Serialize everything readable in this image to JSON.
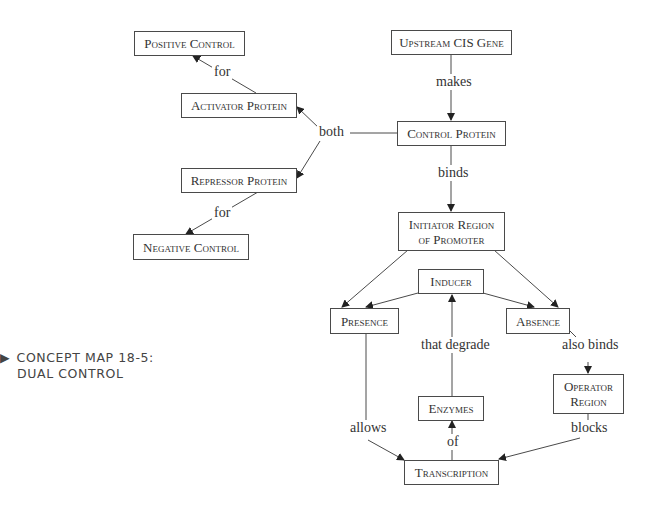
{
  "caption": {
    "marker": "▶",
    "line1": "CONCEPT MAP 18-5:",
    "line2": "DUAL CONTROL"
  },
  "nodes": {
    "positive_control": "Positive Control",
    "activator_protein": "Activator Protein",
    "upstream_cis_gene": "Upstream CIS Gene",
    "control_protein": "Control Protein",
    "repressor_protein": "Repressor Protein",
    "negative_control": "Negative Control",
    "initiator_region": "Initiator Region of Promoter",
    "inducer": "Inducer",
    "presence": "Presence",
    "absence": "Absence",
    "operator_region": "Operator Region",
    "enzymes": "Enzymes",
    "transcription": "Transcription"
  },
  "links": {
    "for_positive": "for",
    "both": "both",
    "makes": "makes",
    "for_negative": "for",
    "binds": "binds",
    "that_degrade": "that degrade",
    "also_binds": "also binds",
    "allows": "allows",
    "of": "of",
    "blocks": "blocks"
  },
  "colors": {
    "line": "#4a4a4a",
    "text": "#333333",
    "background": "#ffffff"
  }
}
